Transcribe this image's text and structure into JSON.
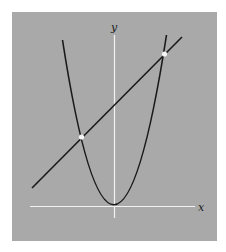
{
  "figure": {
    "background_color": "#a9a9a9",
    "curve_color": "#1a1a1a",
    "axis_color": "#f2f2f2",
    "point_color": "#f5f5f5"
  },
  "axes": {
    "x_label": "x",
    "y_label": "y"
  },
  "curves": [
    {
      "name": "parabola",
      "type": "parabola",
      "vertex": "origin"
    },
    {
      "name": "line",
      "type": "line",
      "slope_sign": "positive"
    }
  ],
  "intersection_points": [
    {
      "name": "left-intersection",
      "position": "left of y-axis"
    },
    {
      "name": "right-intersection",
      "position": "right of y-axis"
    }
  ]
}
